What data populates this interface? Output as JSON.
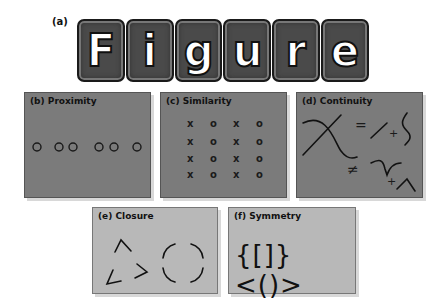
{
  "figure": {
    "a": {
      "label": "(a)",
      "word": "Figure",
      "letters": [
        "F",
        "i",
        "g",
        "u",
        "r",
        "e"
      ]
    },
    "panels": [
      {
        "id": "b",
        "title": "(b) Proximity"
      },
      {
        "id": "c",
        "title": "(c) Similarity"
      },
      {
        "id": "d",
        "title": "(d) Continuity",
        "symbols": {
          "equals": "=",
          "not_equals": "≠",
          "plus1": "+",
          "plus2": "+"
        }
      },
      {
        "id": "e",
        "title": "(e) Closure"
      },
      {
        "id": "f",
        "title": "(f) Symmetry",
        "glyphs": "{[]}<()>"
      }
    ],
    "similarity_grid": [
      [
        "x",
        "o",
        "x",
        "o"
      ],
      [
        "x",
        "o",
        "x",
        "o"
      ],
      [
        "x",
        "o",
        "x",
        "o"
      ],
      [
        "x",
        "o",
        "x",
        "o"
      ]
    ]
  },
  "colors": {
    "dark_panel": "#7b7b7b",
    "light_panel": "#b8b8b8",
    "ink": "#111111"
  }
}
